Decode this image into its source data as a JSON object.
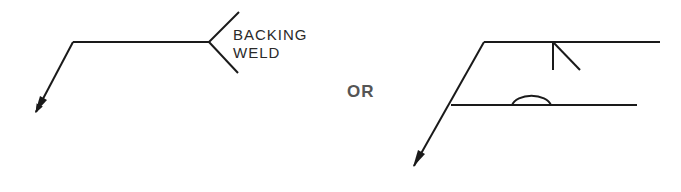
{
  "figure": {
    "stroke_color": "#1a1a1a",
    "text_color": "#2a2a2a",
    "background": "#ffffff"
  },
  "left_symbol": {
    "name": "weld symbol with tail note",
    "tail_note_line1": "BACKING",
    "tail_note_line2": "WELD",
    "reference_line": {
      "x1": 73,
      "y1": 42,
      "x2": 209,
      "y2": 42
    },
    "arrow_leader": {
      "x1": 73,
      "y1": 42,
      "x2": 35,
      "y2": 113
    },
    "tail": {
      "vertex": [
        209,
        42
      ],
      "upper": [
        239,
        12
      ],
      "lower": [
        238,
        73
      ]
    }
  },
  "separator": {
    "label": "OR"
  },
  "right_symbol": {
    "name": "multiple reference line weld symbol",
    "top_reference_line": {
      "x1": 484,
      "y1": 42,
      "x2": 660,
      "y2": 42
    },
    "bottom_reference_line": {
      "x1": 451,
      "y1": 105,
      "x2": 637,
      "y2": 105
    },
    "arrow_leader": {
      "x1": 484,
      "y1": 42,
      "x2": 413,
      "y2": 167
    },
    "bevel_weld_symbol": "bevel groove (below top reference line)",
    "backing_weld_symbol": "back/backing weld semicircle (above bottom reference line)"
  }
}
